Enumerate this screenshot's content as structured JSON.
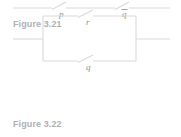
{
  "page": {
    "background_color": "#ffffff",
    "line_color": "#d9d9dc",
    "label_color": "#8d8d90",
    "caption_color": "#b0b0b2",
    "width": 181,
    "height": 137
  },
  "figures": [
    {
      "id": "figure-3-21",
      "caption": "Figure 3.21",
      "type": "series-switching-circuit",
      "description": "Series circuit with two open switches on one horizontal wire",
      "wire": {
        "y": 8,
        "x_start": 13,
        "x_end": 170
      },
      "switches": [
        {
          "name": "switch-p",
          "label": "p",
          "label_has_overbar": false,
          "pivot_x": 57,
          "open_to": "upper-right",
          "label_x": 61,
          "label_y": 15
        },
        {
          "name": "switch-q-bar",
          "label": "q",
          "label_has_overbar": true,
          "pivot_x": 120,
          "open_to": "upper-right",
          "label_x": 124,
          "label_y": 15
        }
      ]
    },
    {
      "id": "figure-3-22",
      "caption": "Figure 3.22",
      "type": "parallel-switching-circuit",
      "description": "Parallel circuit: rectangle with a switch on the top branch and a switch on the bottom branch, horizontal leads left and right",
      "rectangle": {
        "left": 43,
        "right": 136,
        "top": 61,
        "bottom": 106
      },
      "leads": [
        {
          "name": "left-lead",
          "y": 84,
          "x_start": 13,
          "x_end": 43
        },
        {
          "name": "right-lead",
          "y": 84,
          "x_start": 136,
          "x_end": 170
        }
      ],
      "switches": [
        {
          "name": "switch-r",
          "label": "r",
          "label_has_overbar": false,
          "branch": "top",
          "pivot_x": 83,
          "open_to": "upper-right",
          "label_x": 88,
          "label_y": 70
        },
        {
          "name": "switch-q",
          "label": "q",
          "label_has_overbar": false,
          "branch": "bottom",
          "pivot_x": 83,
          "open_to": "upper-right",
          "label_x": 88,
          "label_y": 114
        }
      ]
    }
  ]
}
